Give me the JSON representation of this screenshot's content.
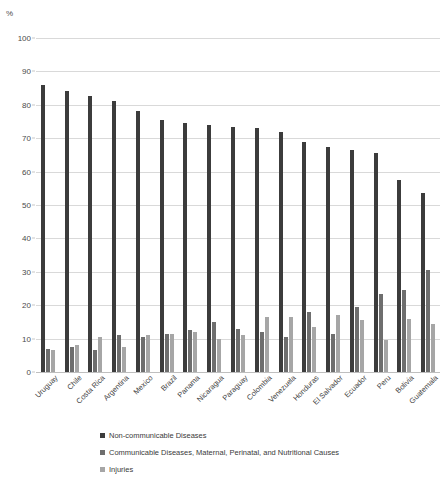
{
  "chart_data": {
    "type": "bar",
    "title": "",
    "subtitle": "",
    "xlabel": "",
    "ylabel": "%",
    "unit_label": "%",
    "ylim": [
      0,
      100
    ],
    "ytick_step": 10,
    "yticks": [
      100,
      90,
      80,
      70,
      60,
      50,
      40,
      30,
      20,
      10,
      0
    ],
    "grid": true,
    "legend_position": "bottom",
    "categories": [
      "Uruguay",
      "Chile",
      "Costa Rica",
      "Argentina",
      "Mexico",
      "Brazil",
      "Panama",
      "Nicaragua",
      "Paraguay",
      "Colombia",
      "Venezuela",
      "Honduras",
      "El Salvador",
      "Ecuador",
      "Peru",
      "Bolivia",
      "Guatemala"
    ],
    "series": [
      {
        "name": "Non-communicable Diseases",
        "color": "#3c3c3c",
        "values": [
          86.0,
          84.0,
          82.5,
          81.0,
          78.0,
          75.5,
          74.5,
          74.0,
          73.5,
          73.0,
          72.0,
          69.0,
          67.5,
          66.5,
          65.5,
          57.5,
          53.5
        ]
      },
      {
        "name": "Communicable Diseases, Maternal, Perinatal, and Nutritional Causes",
        "color": "#6e6e6e",
        "values": [
          7.0,
          7.5,
          6.5,
          11.0,
          10.5,
          11.5,
          12.5,
          15.0,
          13.0,
          12.0,
          10.5,
          18.0,
          11.5,
          19.5,
          23.5,
          24.5,
          30.5
        ]
      },
      {
        "name": "Injuries",
        "color": "#a6a6a6",
        "values": [
          6.5,
          8.0,
          10.5,
          7.5,
          11.0,
          11.5,
          12.0,
          10.0,
          11.0,
          16.5,
          16.5,
          13.5,
          17.0,
          15.5,
          9.5,
          16.0,
          14.5
        ]
      }
    ]
  },
  "legend": {
    "items": [
      {
        "label": "Non-communicable Diseases"
      },
      {
        "label": "Communicable Diseases, Maternal, Perinatal, and Nutritional Causes"
      },
      {
        "label": "Injuries"
      }
    ]
  }
}
